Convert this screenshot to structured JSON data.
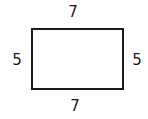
{
  "figure": {
    "background_color": "#ffffff",
    "stroke_color": "#1a1a1a",
    "text_color": "#1a1a1a",
    "stroke_width": 2.6
  },
  "shape": {
    "name": "rectangle",
    "x": 32,
    "y": 29,
    "width": 91,
    "height": 60,
    "fill": "none"
  },
  "labels": {
    "top": "7",
    "bottom": "7",
    "left": "5",
    "right": "5"
  },
  "chart_data": {
    "type": "diagram",
    "shape": "rectangle",
    "sides": [
      {
        "position": "top",
        "label": "7",
        "value": 7
      },
      {
        "position": "right",
        "label": "5",
        "value": 5
      },
      {
        "position": "bottom",
        "label": "7",
        "value": 7
      },
      {
        "position": "left",
        "label": "5",
        "value": 5
      }
    ],
    "length": 7,
    "width": 5,
    "units": "",
    "grid": false,
    "legend": false
  }
}
